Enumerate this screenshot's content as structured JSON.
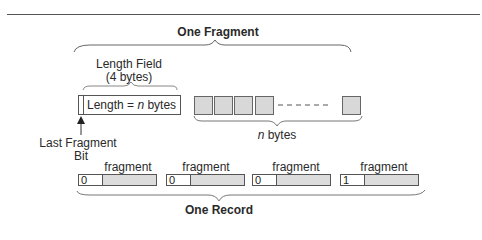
{
  "diagram": {
    "fragment_title": "One Fragment",
    "length_field": {
      "label_line1": "Length Field",
      "label_line2": "(4 bytes)",
      "box_text_prefix": "Length = ",
      "box_text_var": "n",
      "box_text_suffix": " bytes"
    },
    "last_fragment_bit": {
      "label_line1": "Last Fragment",
      "label_line2": "Bit"
    },
    "payload": {
      "byte_count_var": "n",
      "byte_count_suffix": " bytes",
      "visible_bytes": 5
    },
    "record": {
      "title": "One Record",
      "fragments": [
        {
          "label": "fragment",
          "flag": "0"
        },
        {
          "label": "fragment",
          "flag": "0"
        },
        {
          "label": "fragment",
          "flag": "0"
        },
        {
          "label": "fragment",
          "flag": "1"
        }
      ]
    },
    "colors": {
      "line": "#555555",
      "byte_fill": "#d8d8d8",
      "fragment_fill": "#dcdcdc"
    }
  }
}
